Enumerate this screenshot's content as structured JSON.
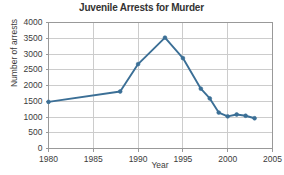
{
  "chart_data": {
    "type": "line",
    "title": "Juvenile Arrests for Murder",
    "xlabel": "Year",
    "ylabel": "Number of arrests",
    "xlim": [
      1980,
      2005
    ],
    "ylim": [
      0,
      4000
    ],
    "xticks": [
      1980,
      1985,
      1990,
      1995,
      2000,
      2005
    ],
    "yticks": [
      0,
      500,
      1000,
      1500,
      2000,
      2500,
      3000,
      3500,
      4000
    ],
    "grid": true,
    "legend": null,
    "series": [
      {
        "name": "Juvenile arrests for murder",
        "color": "#3b6f96",
        "marker": "circle",
        "x": [
          1980,
          1988,
          1990,
          1993,
          1995,
          1997,
          1998,
          1999,
          2000,
          2001,
          2002,
          2003
        ],
        "values": [
          1480,
          1810,
          2680,
          3520,
          2870,
          1900,
          1590,
          1140,
          1020,
          1080,
          1040,
          960
        ]
      }
    ]
  },
  "axes": {
    "y_tick_labels": [
      "4000",
      "3500",
      "3000",
      "2500",
      "2000",
      "1500",
      "1000",
      "500",
      "0"
    ],
    "x_tick_labels": [
      "1980",
      "1985",
      "1990",
      "1995",
      "2000",
      "2005"
    ]
  },
  "style": {
    "line_color": "#3b6f96",
    "grid_color": "#cccccc",
    "axis_color": "#999999",
    "background": "#ffffff",
    "title_color": "#333333"
  }
}
